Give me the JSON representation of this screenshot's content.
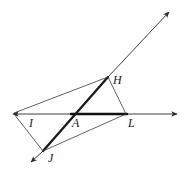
{
  "figure": {
    "type": "geometry-diagram",
    "width": 191,
    "height": 172,
    "background": "#ffffff",
    "stroke_color": "#2b2b2b",
    "thick_stroke_color": "#111111",
    "thin_width": 0.9,
    "thick_width": 2.4,
    "points": {
      "I": {
        "x": 24,
        "y": 114
      },
      "A": {
        "x": 72,
        "y": 114
      },
      "L": {
        "x": 126,
        "y": 114
      },
      "H": {
        "x": 108,
        "y": 77
      },
      "J": {
        "x": 43,
        "y": 151
      }
    },
    "arrow_tips": {
      "horizontal_left": {
        "x": 11,
        "y": 114
      },
      "horizontal_right": {
        "x": 179,
        "y": 114
      },
      "ray_upper_right": {
        "x": 171,
        "y": 10
      },
      "ray_lower_left": {
        "x": 29,
        "y": 164
      }
    },
    "segments": [
      {
        "name": "horizontal-line-left",
        "from": "horizontal_left",
        "to": "A",
        "weight": "thin"
      },
      {
        "name": "horizontal-line-thick-A-to-L",
        "from": "A",
        "to": "L",
        "weight": "thick"
      },
      {
        "name": "horizontal-line-right",
        "from": "L",
        "to": "horizontal_right",
        "weight": "thin"
      },
      {
        "name": "ray-J-to-H-thick",
        "from": "J",
        "to": "H",
        "weight": "thick"
      },
      {
        "name": "ray-H-to-upper-right",
        "from": "H",
        "to": "ray_upper_right",
        "weight": "thin"
      },
      {
        "name": "ray-J-to-lower-left",
        "from": "J",
        "to": "ray_lower_left",
        "weight": "thin"
      },
      {
        "name": "segment-I-to-H",
        "from": "I_tip",
        "to": "H",
        "weight": "thin"
      },
      {
        "name": "segment-H-to-L",
        "from": "H",
        "to": "L",
        "weight": "thin"
      },
      {
        "name": "segment-I-to-J",
        "from": "I_tip",
        "to": "J",
        "weight": "thin"
      },
      {
        "name": "segment-J-to-L",
        "from": "J",
        "to": "L",
        "weight": "thin"
      }
    ],
    "labels": [
      {
        "name": "point-label-H",
        "text": "H",
        "x": 113,
        "y": 75
      },
      {
        "name": "point-label-I",
        "text": "I",
        "x": 28,
        "y": 118
      },
      {
        "name": "point-label-A",
        "text": "A",
        "x": 73,
        "y": 118
      },
      {
        "name": "point-label-L",
        "text": "L",
        "x": 128,
        "y": 118
      },
      {
        "name": "point-label-J",
        "text": "J",
        "x": 47,
        "y": 152
      }
    ]
  }
}
